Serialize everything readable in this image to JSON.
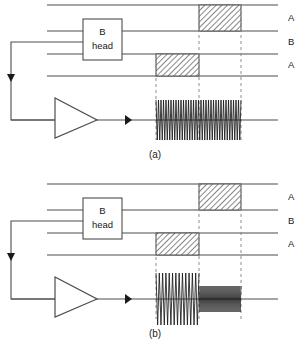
{
  "figure": {
    "width": 308,
    "height": 349,
    "background": "#ffffff",
    "line_color": "#4d4d4d",
    "dash_color": "#8c8c8c",
    "ink_color": "#1a1a1a",
    "hatch_color": "#555555"
  },
  "panels": [
    {
      "id": "panel-a",
      "caption": "(a)",
      "caption_x": 155,
      "caption_y": 158,
      "offset_y": 0,
      "track_lines": [
        {
          "name": "track-line-1",
          "y": 5,
          "x1": 47,
          "x2": 278
        },
        {
          "name": "track-line-2",
          "y": 31,
          "x1": 47,
          "x2": 278
        },
        {
          "name": "track-line-3",
          "y": 54,
          "x1": 47,
          "x2": 278
        },
        {
          "name": "track-line-4",
          "y": 76,
          "x1": 47,
          "x2": 278
        }
      ],
      "track_labels": [
        {
          "text": "A",
          "x": 288,
          "y": 21
        },
        {
          "text": "B",
          "x": 288,
          "y": 45
        },
        {
          "text": "A",
          "x": 288,
          "y": 68
        }
      ],
      "head_box": {
        "label_top": "B",
        "label_bottom": "head",
        "x": 83,
        "y": 19,
        "w": 39,
        "h": 41,
        "text_top_y": 35,
        "text_bottom_y": 49
      },
      "hatch_blocks": [
        {
          "name": "hatch-block-upper",
          "x": 199,
          "y": 5,
          "w": 42,
          "h": 26
        },
        {
          "name": "hatch-block-lower",
          "x": 156,
          "y": 54,
          "w": 43,
          "h": 22
        }
      ],
      "dashed_verticals": [
        {
          "x": 156,
          "y1": 54,
          "y2": 140
        },
        {
          "x": 199,
          "y1": 5,
          "y2": 140
        },
        {
          "x": 241,
          "y1": 5,
          "y2": 140
        }
      ],
      "baseline": {
        "y": 120,
        "x1": 11,
        "x2": 278
      },
      "amplifier": {
        "x1": 55,
        "y1": 98,
        "x2": 97,
        "y2": 138,
        "tip_y": 120
      },
      "output_arrow": {
        "x": 125,
        "y": 120,
        "size": 5
      },
      "feedback": {
        "x": 11,
        "y_top": 42,
        "y_bottom": 120,
        "x_to_box": 83,
        "arrow_y": 80
      },
      "waveform": {
        "type": "burst",
        "segments": [
          {
            "x1": 156,
            "x2": 241,
            "amplitude": 20,
            "cycles": 34
          }
        ]
      }
    },
    {
      "id": "panel-b",
      "caption": "(b)",
      "caption_x": 155,
      "caption_y": 337,
      "offset_y": 179,
      "track_lines": [
        {
          "name": "track-line-1",
          "y": 184,
          "x1": 47,
          "x2": 278
        },
        {
          "name": "track-line-2",
          "y": 210,
          "x1": 47,
          "x2": 278
        },
        {
          "name": "track-line-3",
          "y": 233,
          "x1": 47,
          "x2": 278
        },
        {
          "name": "track-line-4",
          "y": 255,
          "x1": 47,
          "x2": 278
        }
      ],
      "track_labels": [
        {
          "text": "A",
          "x": 288,
          "y": 200
        },
        {
          "text": "B",
          "x": 288,
          "y": 224
        },
        {
          "text": "A",
          "x": 288,
          "y": 247
        }
      ],
      "head_box": {
        "label_top": "B",
        "label_bottom": "head",
        "x": 83,
        "y": 198,
        "w": 39,
        "h": 41,
        "text_top_y": 214,
        "text_bottom_y": 228
      },
      "hatch_blocks": [
        {
          "name": "hatch-block-upper",
          "x": 199,
          "y": 184,
          "w": 42,
          "h": 26
        },
        {
          "name": "hatch-block-lower",
          "x": 156,
          "y": 233,
          "w": 43,
          "h": 22
        }
      ],
      "dashed_verticals": [
        {
          "x": 156,
          "y1": 233,
          "y2": 319
        },
        {
          "x": 199,
          "y1": 184,
          "y2": 319
        },
        {
          "x": 241,
          "y1": 184,
          "y2": 319
        }
      ],
      "baseline": {
        "y": 299,
        "x1": 11,
        "x2": 278
      },
      "amplifier": {
        "x1": 55,
        "y1": 277,
        "x2": 97,
        "y2": 317,
        "tip_y": 299
      },
      "output_arrow": {
        "x": 125,
        "y": 299,
        "size": 5
      },
      "feedback": {
        "x": 11,
        "y_top": 221,
        "y_bottom": 299,
        "x_to_box": 83,
        "arrow_y": 259
      },
      "waveform": {
        "type": "burst-two-level",
        "segments": [
          {
            "x1": 156,
            "x2": 199,
            "amplitude": 26,
            "cycles": 13
          },
          {
            "x1": 199,
            "x2": 241,
            "amplitude": 13,
            "cycles": 21
          }
        ]
      }
    }
  ]
}
